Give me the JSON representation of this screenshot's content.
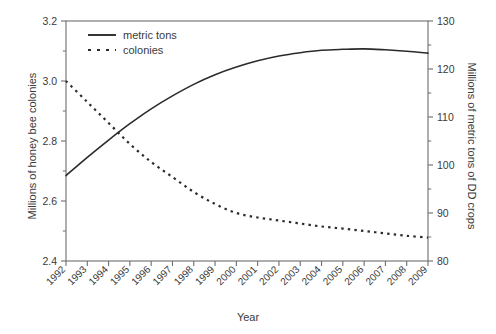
{
  "chart_data": {
    "type": "line",
    "title": "",
    "xlabel": "Year",
    "ylabel": "Millions of honey bee colonies",
    "ylabel_right": "Millions of metric tons of DD crops",
    "grid": false,
    "legend_position": "top-left",
    "x": [
      1992,
      1993,
      1994,
      1995,
      1996,
      1997,
      1998,
      1999,
      2000,
      2001,
      2002,
      2003,
      2004,
      2005,
      2006,
      2007,
      2008,
      2009
    ],
    "xtick_labels": [
      "1992",
      "1993",
      "1994",
      "1995",
      "1996",
      "1997",
      "1998",
      "1999",
      "2000",
      "2001",
      "2002",
      "2003",
      "2004",
      "2005",
      "2006",
      "2007",
      "2008",
      "2009"
    ],
    "xlim": [
      1992,
      2009
    ],
    "ylim": [
      2.4,
      3.2
    ],
    "ytick_labels": [
      "3.2",
      "3.0",
      "2.8",
      "2.6",
      "2.4"
    ],
    "ytick_values": [
      3.2,
      3.0,
      2.8,
      2.6,
      2.4
    ],
    "ylim_right": [
      80,
      130
    ],
    "ytick_labels_right": [
      "130",
      "120",
      "110",
      "100",
      "90",
      "80"
    ],
    "ytick_values_right": [
      130,
      120,
      110,
      100,
      90,
      80
    ],
    "series": [
      {
        "name": "metric tons",
        "axis": "right",
        "style": "solid",
        "color": "#2b2b2b",
        "values": [
          97.8,
          101.6,
          105.2,
          108.6,
          111.7,
          114.4,
          116.8,
          118.8,
          120.4,
          121.7,
          122.7,
          123.4,
          123.9,
          124.1,
          124.2,
          124.0,
          123.7,
          123.3
        ]
      },
      {
        "name": "colonies",
        "axis": "left",
        "style": "dotted",
        "color": "#2b2b2b",
        "values": [
          3.0,
          2.93,
          2.86,
          2.79,
          2.73,
          2.68,
          2.63,
          2.59,
          2.56,
          2.545,
          2.535,
          2.525,
          2.515,
          2.508,
          2.5,
          2.492,
          2.484,
          2.478
        ]
      }
    ]
  },
  "legend": {
    "items": [
      {
        "label": "metric tons",
        "style": "solid"
      },
      {
        "label": "colonies",
        "style": "dotted"
      }
    ]
  }
}
